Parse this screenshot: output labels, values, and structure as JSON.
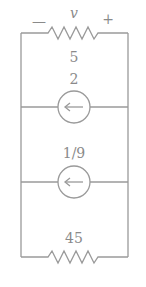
{
  "circuit": {
    "top_resistor": {
      "voltage_label": "v",
      "minus": "—",
      "plus": "+",
      "value": "5"
    },
    "source_1": {
      "value": "2",
      "direction": "left"
    },
    "source_2": {
      "value": "1/9",
      "direction": "left"
    },
    "bottom_resistor": {
      "value": "45"
    },
    "colors": {
      "wire": "#9a9a9a",
      "text": "#8a8a8a",
      "background": "#ffffff"
    }
  }
}
